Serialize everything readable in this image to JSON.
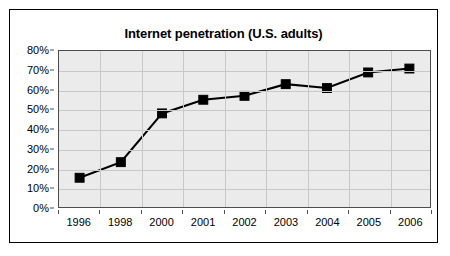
{
  "chart_data": {
    "type": "line",
    "title": "Internet penetration (U.S. adults)",
    "xlabel": "",
    "ylabel": "",
    "categories": [
      "1996",
      "1998",
      "2000",
      "2001",
      "2002",
      "2003",
      "2004",
      "2005",
      "2006"
    ],
    "values": [
      15,
      23,
      48,
      55,
      57,
      63,
      61,
      69,
      71
    ],
    "value_unit": "%",
    "ylim": [
      0,
      80
    ],
    "ytick_step": 10,
    "ytick_labels": [
      "0%",
      "10%",
      "20%",
      "30%",
      "40%",
      "50%",
      "60%",
      "70%",
      "80%"
    ],
    "ytick_values": [
      0,
      10,
      20,
      30,
      40,
      50,
      60,
      70,
      80
    ],
    "grid": {
      "horizontal": true,
      "vertical": true,
      "color": "#c8c8c8"
    },
    "legend": {
      "visible": false,
      "position": "none"
    },
    "series": [
      {
        "name": "Internet penetration (U.S. adults)",
        "values": [
          15,
          23,
          48,
          55,
          57,
          63,
          61,
          69,
          71
        ],
        "line_color": "#000000",
        "marker": "square",
        "marker_color": "#000000"
      }
    ],
    "plot_background": "#ebebeb",
    "chart_background": "#ffffff",
    "border_color": "#000000"
  }
}
